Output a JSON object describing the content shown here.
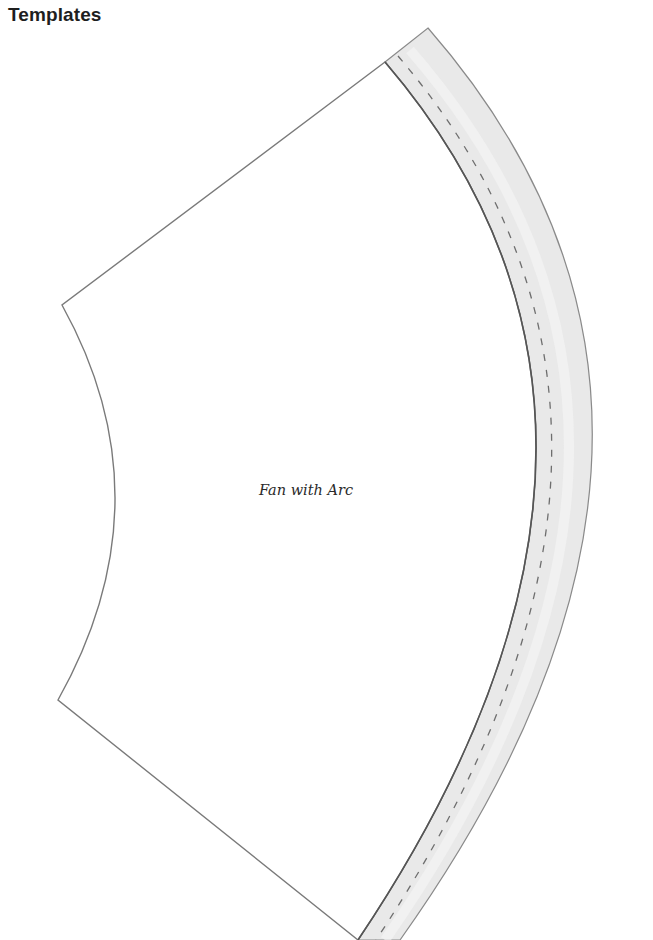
{
  "page": {
    "title": "Templates"
  },
  "template": {
    "label": "Fan with Arc",
    "shapes": [
      {
        "name": "Fan",
        "fill": "#ffffff"
      },
      {
        "name": "Arc",
        "fill": "#e9e9e9"
      }
    ]
  },
  "colors": {
    "outline": "#7a7a7a",
    "arc_fill": "#e9e9e9",
    "seam_line": "#6e6e6e",
    "title": "#1e1e1e"
  }
}
